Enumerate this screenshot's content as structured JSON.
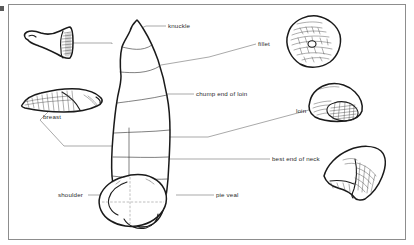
{
  "diagram": {
    "frame_color": "#8d8d8d",
    "background_color": "#ffffff",
    "ink_color": "#1a1a1a",
    "leader_line_color": "#6a6a6a",
    "labels": [
      {
        "id": "knuckle",
        "text": "knuckle",
        "x": 168,
        "y": 27,
        "align": "left"
      },
      {
        "id": "fillet",
        "text": "fillet",
        "x": 258,
        "y": 45,
        "align": "left"
      },
      {
        "id": "chump-end-of-loin",
        "text": "chump end of loin",
        "x": 196,
        "y": 95,
        "align": "left"
      },
      {
        "id": "breast",
        "text": "breast",
        "x": 43,
        "y": 118,
        "align": "left"
      },
      {
        "id": "loin",
        "text": "loin",
        "x": 296,
        "y": 112,
        "align": "left"
      },
      {
        "id": "best-end-of-neck",
        "text": "best end of neck",
        "x": 272,
        "y": 160,
        "align": "left"
      },
      {
        "id": "shoulder",
        "text": "shoulder",
        "x": 58,
        "y": 196,
        "align": "left"
      },
      {
        "id": "pie-veal",
        "text": "pie veal",
        "x": 216,
        "y": 195,
        "align": "left"
      }
    ],
    "cuts": [
      {
        "id": "knuckle-cut",
        "name": "knuckle",
        "position": "top-left",
        "shape": "tapered cone with hatched cut face"
      },
      {
        "id": "fillet-cut",
        "name": "fillet",
        "position": "top-right",
        "shape": "rounded oval with dense marbled hatching"
      },
      {
        "id": "breast-cut",
        "name": "breast",
        "position": "middle-left",
        "shape": "long flat wedge with rib hatching"
      },
      {
        "id": "loin-cut",
        "name": "loin",
        "position": "middle-right",
        "shape": "rounded dome with hatched eye of meat"
      },
      {
        "id": "best-end-neck-cut",
        "name": "best end of neck",
        "position": "lower-right",
        "shape": "curved crescent rack with hatched face"
      },
      {
        "id": "carcass",
        "name": "veal carcass side",
        "position": "center",
        "shape": "elongated side of veal divided into numbered cut sections"
      }
    ]
  }
}
